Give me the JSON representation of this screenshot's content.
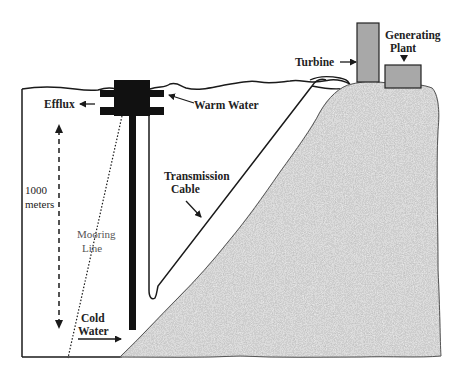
{
  "diagram": {
    "labels": {
      "efflux": "Efflux",
      "warm_water": "Warm Water",
      "depth_value": "1000",
      "depth_unit": "meters",
      "mooring_line_1": "Mooring",
      "mooring_line_2": "Line",
      "transmission_1": "Transmission",
      "transmission_2": "Cable",
      "cold_water_1": "Cold",
      "cold_water_2": "Water",
      "turbine": "Turbine",
      "generating_1": "Generating",
      "generating_2": "Plant"
    },
    "colors": {
      "ink": "#1a1a1a",
      "rock_base": "#9a9a9a",
      "rock_light": "#c4c4c4",
      "rock_dark": "#5a5a5a",
      "building_fill": "#a8a8a8",
      "background": "#ffffff"
    }
  }
}
